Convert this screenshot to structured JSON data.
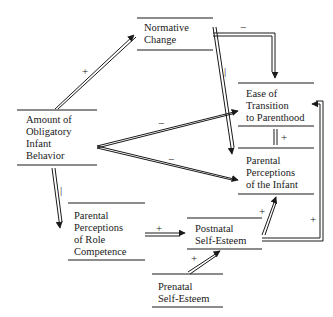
{
  "nodes": {
    "normative_change": {
      "lines": [
        "Normative",
        "Change"
      ]
    },
    "amount_obligatory": {
      "lines": [
        "Amount of",
        "Obligatory",
        "Infant",
        "Behavior"
      ]
    },
    "ease_transition": {
      "lines": [
        "Ease of",
        "Transition",
        "to Parenthood"
      ]
    },
    "perceptions_infant": {
      "lines": [
        "Parental",
        "Perceptions",
        "of the Infant"
      ]
    },
    "perceptions_role": {
      "lines": [
        "Parental",
        "Perceptions",
        "of Role",
        "Competence"
      ]
    },
    "postnatal_esteem": {
      "lines": [
        "Postnatal",
        "Self-Esteem"
      ]
    },
    "prenatal_esteem": {
      "lines": [
        "Prenatal",
        "Self-Esteem"
      ]
    }
  },
  "edges": [
    {
      "from": "Amount of Obligatory Infant Behavior",
      "to": "Normative Change",
      "sign": "+"
    },
    {
      "from": "Normative Change",
      "to": "Ease of Transition to Parenthood",
      "sign": "−"
    },
    {
      "from": "Normative Change",
      "to": "Parental Perceptions of the Infant",
      "sign": "|"
    },
    {
      "from": "Amount of Obligatory Infant Behavior",
      "to": "Ease of Transition to Parenthood",
      "sign": "−"
    },
    {
      "from": "Amount of Obligatory Infant Behavior",
      "to": "Parental Perceptions of the Infant",
      "sign": "−"
    },
    {
      "from": "Amount of Obligatory Infant Behavior",
      "to": "Parental Perceptions of Role Competence",
      "sign": "|"
    },
    {
      "from": "Ease of Transition to Parenthood",
      "to": "Parental Perceptions of the Infant",
      "sign": "+",
      "bidirectional_link": true
    },
    {
      "from": "Parental Perceptions of Role Competence",
      "to": "Postnatal Self-Esteem",
      "sign": "+"
    },
    {
      "from": "Prenatal Self-Esteem",
      "to": "Postnatal Self-Esteem",
      "sign": "+"
    },
    {
      "from": "Postnatal Self-Esteem",
      "to": "Parental Perceptions of the Infant",
      "sign": "+"
    },
    {
      "from": "Postnatal Self-Esteem",
      "to": "Ease of Transition to Parenthood",
      "sign": "+"
    }
  ],
  "signs": {
    "amount_to_normative": "+",
    "normative_to_ease": "−",
    "normative_to_infant": "|",
    "amount_to_ease": "−",
    "amount_to_infant": "−",
    "amount_to_role": "|",
    "ease_infant_link": "+",
    "role_to_postnatal": "+",
    "prenatal_to_postnatal": "+",
    "postnatal_to_infant": "+",
    "postnatal_to_ease": "+"
  }
}
